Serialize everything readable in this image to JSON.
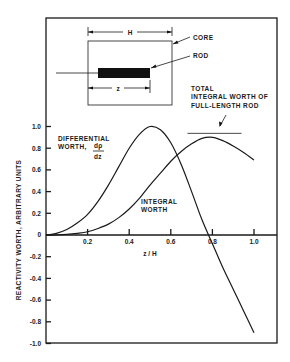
{
  "chart_data": {
    "type": "line",
    "title": "",
    "xlabel": "z / H",
    "ylabel": "REACTIVITY WORTH, ARBITRARY UNITS",
    "xlim": [
      0,
      1.1
    ],
    "ylim": [
      -1.0,
      1.0
    ],
    "grid": false,
    "x_ticks": [
      0.2,
      0.4,
      0.6,
      0.8,
      1.0
    ],
    "x_tick_labels": [
      "0.2",
      "0.4",
      "0.6",
      "0.8",
      "1.0"
    ],
    "y_ticks": [
      1.0,
      0.8,
      0.6,
      0.4,
      0.2,
      0,
      -0.2,
      -0.4,
      -0.6,
      -0.8,
      -1.0
    ],
    "y_tick_labels": [
      "1.0",
      "0.8",
      "0.6",
      "0.4",
      "0.2",
      "0",
      "-0.2",
      "-0.4",
      "-0.6",
      "-0.8",
      "-1.0"
    ],
    "x": [
      0,
      0.05,
      0.1,
      0.15,
      0.2,
      0.25,
      0.3,
      0.35,
      0.4,
      0.45,
      0.5,
      0.55,
      0.6,
      0.65,
      0.7,
      0.75,
      0.8,
      0.85,
      0.9,
      0.95,
      1.0
    ],
    "series": [
      {
        "name": "Differential worth, dρ/dz",
        "values": [
          0,
          0.015,
          0.05,
          0.11,
          0.19,
          0.31,
          0.46,
          0.63,
          0.8,
          0.93,
          1.0,
          0.97,
          0.85,
          0.65,
          0.4,
          0.14,
          -0.08,
          -0.3,
          -0.5,
          -0.7,
          -0.9
        ]
      },
      {
        "name": "Integral worth",
        "values": [
          0,
          0.0,
          0.005,
          0.015,
          0.03,
          0.06,
          0.1,
          0.16,
          0.24,
          0.34,
          0.46,
          0.57,
          0.68,
          0.77,
          0.84,
          0.89,
          0.9,
          0.87,
          0.82,
          0.76,
          0.69
        ]
      }
    ],
    "annotations": {
      "differential_label": [
        "DIFFERENTIAL",
        "WORTH,"
      ],
      "differential_frac_num": "dρ",
      "differential_frac_den": "dz",
      "integral_label": [
        "INTEGRAL",
        "WORTH"
      ],
      "total_label": [
        "TOTAL",
        "INTEGRAL WORTH OF",
        "FULL-LENGTH ROD"
      ],
      "total_value": 0.9,
      "total_range": [
        0.68,
        0.94
      ]
    },
    "inset": {
      "core_label": "CORE",
      "rod_label": "ROD",
      "height_label": "H",
      "insertion_label": "z"
    }
  }
}
